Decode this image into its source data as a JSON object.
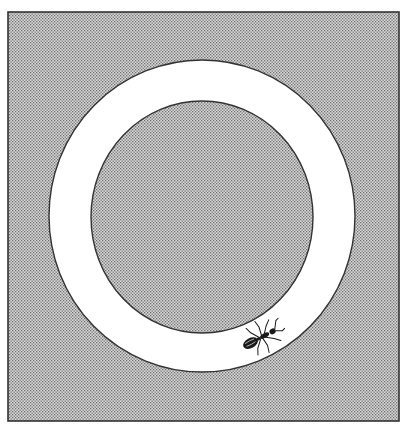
{
  "figure": {
    "colors": {
      "background": "#ffffff",
      "stipple_dark": "#6e6e6e",
      "stipple_light": "#d8d8d8",
      "ring": "#ffffff",
      "outline": "#333333",
      "ant": "#1a1a1a"
    },
    "ring": {
      "outer": {
        "cx": 202,
        "cy": 216,
        "rx": 153,
        "ry": 156
      },
      "inner": {
        "cx": 202,
        "cy": 217,
        "rx": 111,
        "ry": 116
      }
    },
    "ant": {
      "x": 262,
      "y": 337,
      "rotation_deg": -28,
      "label": "ant"
    }
  }
}
